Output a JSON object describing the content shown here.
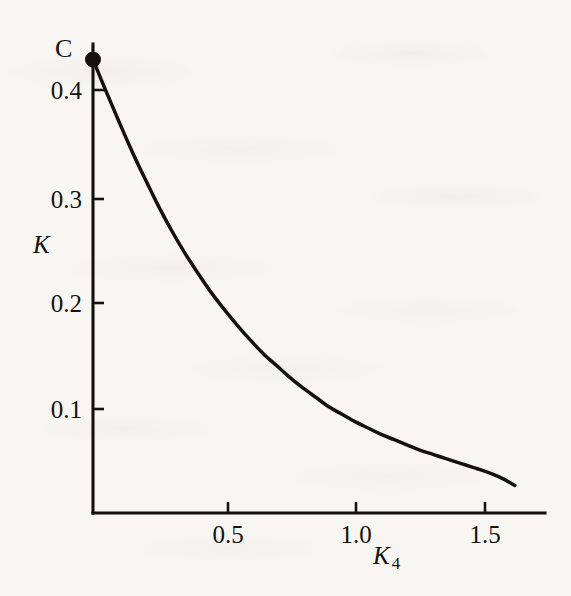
{
  "chart_data": {
    "type": "line",
    "title": "",
    "subtitle": "",
    "xlabel": "K_4",
    "ylabel": "K",
    "corner_label": "C",
    "xlim": [
      0,
      1.67
    ],
    "ylim": [
      0,
      0.455
    ],
    "grid": false,
    "legend": null,
    "x_ticks": [
      {
        "value": 0.5,
        "label": "0.5"
      },
      {
        "value": 1.0,
        "label": "1.0"
      },
      {
        "value": 1.5,
        "label": "1.5"
      }
    ],
    "y_ticks": [
      {
        "value": 0.1,
        "label": "0.1"
      },
      {
        "value": 0.2,
        "label": "0.2"
      },
      {
        "value": 0.3,
        "label": "0.3"
      },
      {
        "value": 0.4,
        "label": "0.4"
      }
    ],
    "series": [
      {
        "name": "K vs K_4",
        "marker_points": [
          {
            "x": 0.0,
            "y": 0.427,
            "label": "C"
          }
        ],
        "x": [
          0.0,
          0.05,
          0.1,
          0.15,
          0.2,
          0.25,
          0.3,
          0.35,
          0.4,
          0.45,
          0.5,
          0.55,
          0.6,
          0.65,
          0.7,
          0.75,
          0.8,
          0.85,
          0.9,
          0.95,
          1.0,
          1.05,
          1.1,
          1.15,
          1.2,
          1.25,
          1.3,
          1.35,
          1.4,
          1.45,
          1.5,
          1.55,
          1.61
        ],
        "y": [
          0.427,
          0.397,
          0.368,
          0.34,
          0.314,
          0.289,
          0.266,
          0.245,
          0.226,
          0.208,
          0.192,
          0.177,
          0.163,
          0.15,
          0.139,
          0.128,
          0.118,
          0.109,
          0.1,
          0.093,
          0.086,
          0.08,
          0.074,
          0.069,
          0.064,
          0.059,
          0.055,
          0.051,
          0.047,
          0.043,
          0.039,
          0.034,
          0.026
        ]
      }
    ]
  },
  "geometry": {
    "origin_x": 93,
    "origin_y": 513,
    "x_axis_right": 545,
    "y_axis_top": 44,
    "px_per_x_unit": 262,
    "px_per_y_unit": 1062,
    "tick_len": 11
  },
  "labels": {
    "corner": "C",
    "y_axis": "K",
    "x_axis_base": "K",
    "x_axis_sub": "4",
    "y_tick_0": "0.1",
    "y_tick_1": "0.2",
    "y_tick_2": "0.3",
    "y_tick_3": "0.4",
    "x_tick_0": "0.5",
    "x_tick_1": "1.0",
    "x_tick_2": "1.5"
  },
  "colors": {
    "ink": "#14110f",
    "paper": "#f7f6f3"
  }
}
